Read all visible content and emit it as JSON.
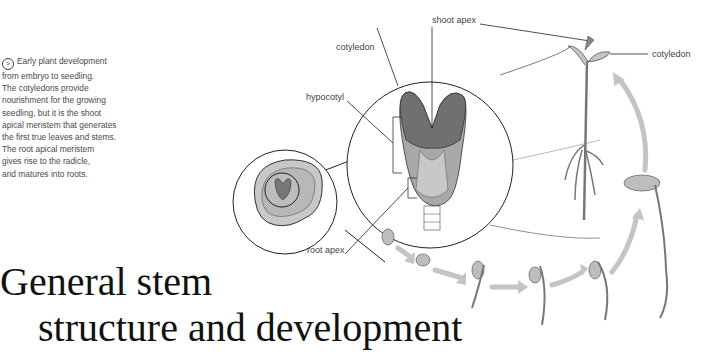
{
  "caption": {
    "icon": "circled-arrow-icon",
    "lines": [
      "Early plant development",
      "from embryo to seedling.",
      "The cotyledons provide",
      "nourishment for the growing",
      "seedling, but it is the shoot",
      "apical meristem that generates",
      "the first true leaves and stems.",
      "The root apical meristem",
      "gives rise to the radicle,",
      "and matures into roots."
    ]
  },
  "title": {
    "line1": "General stem",
    "line2": "structure and development"
  },
  "labels": {
    "shoot_apex": "shoot apex",
    "cotyledon_left": "cotyledon",
    "cotyledon_right": "cotyledon",
    "hypocotyl": "hypocotyl",
    "root_apex": "root apex"
  },
  "colors": {
    "cotyledon_dark": "#707070",
    "tissue_mid": "#a8a8a8",
    "tissue_light": "#c8c8c8",
    "arrow": "#c4c4c4",
    "outline": "#222222"
  }
}
